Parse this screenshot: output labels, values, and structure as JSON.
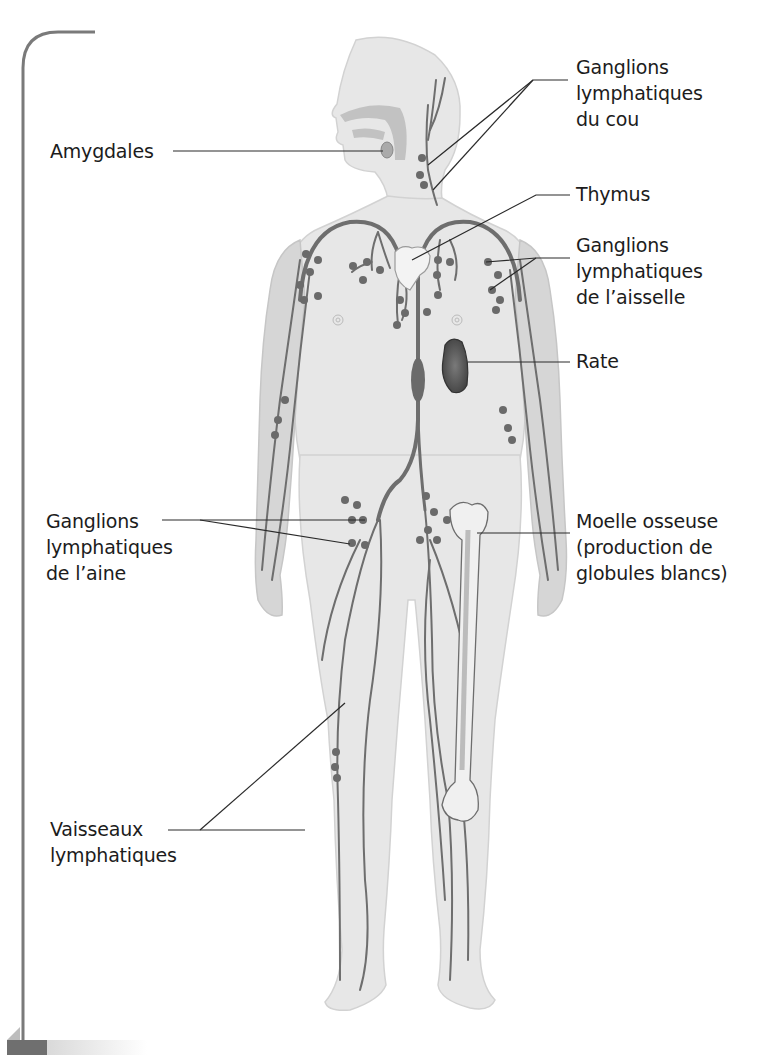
{
  "diagram": {
    "title_hidden": "Système lymphatique",
    "colors": {
      "frame": "#7a7a7a",
      "body_fill": "#e6e6e6",
      "body_light": "#ececec",
      "limb_shade": "#d4d4d4",
      "vessel": "#6e6e6e",
      "node": "#6a6a6a",
      "spleen": "#555555",
      "leader_line": "#2a2a2a",
      "bar_dark": "#6f6f6f"
    },
    "labels": {
      "amygdales": {
        "lines": [
          "Amygdales"
        ]
      },
      "ganglions_cou": {
        "lines": [
          "Ganglions",
          "lymphatiques",
          "du cou"
        ]
      },
      "thymus": {
        "lines": [
          "Thymus"
        ]
      },
      "ganglions_aisselle": {
        "lines": [
          "Ganglions",
          "lymphatiques",
          "de l’aisselle"
        ]
      },
      "rate": {
        "lines": [
          "Rate"
        ]
      },
      "ganglions_aine": {
        "lines": [
          "Ganglions",
          "lymphatiques",
          "de l’aine"
        ]
      },
      "moelle": {
        "lines": [
          "Moelle osseuse",
          "(production de",
          "globules blancs)"
        ]
      },
      "vaisseaux": {
        "lines": [
          "Vaisseaux",
          "lymphatiques"
        ]
      }
    }
  }
}
